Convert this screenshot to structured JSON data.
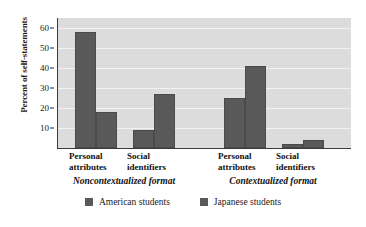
{
  "chart_data": {
    "type": "bar",
    "title": "",
    "xlabel": "",
    "ylabel": "Percent of self-statements",
    "ylim": [
      0,
      65
    ],
    "yticks": [
      10,
      20,
      30,
      40,
      50,
      60
    ],
    "grid": true,
    "legend_position": "bottom",
    "groups": [
      {
        "format_label": "Noncontextualized format",
        "categories": [
          "Personal attributes",
          "Social identifiers"
        ]
      },
      {
        "format_label": "Contextualized format",
        "categories": [
          "Personal attributes",
          "Social identifiers"
        ]
      }
    ],
    "categories": [
      "Personal attributes (Noncontextualized format)",
      "Social identifiers (Noncontextualized format)",
      "Personal attributes (Contextualized format)",
      "Social identifiers (Contextualized format)"
    ],
    "series": [
      {
        "name": "American students",
        "color": "#595959",
        "values": [
          58,
          9,
          25,
          2
        ]
      },
      {
        "name": "Japanese students",
        "color": "#595959",
        "values": [
          18,
          27,
          41,
          4
        ]
      }
    ]
  },
  "axis": {
    "y_title": "Percent of self-statements",
    "tick_labels": [
      "10",
      "20",
      "30",
      "40",
      "50",
      "60"
    ]
  },
  "category_labels": [
    {
      "line1": "Personal",
      "line2": "attributes"
    },
    {
      "line1": "Social",
      "line2": "identifiers"
    },
    {
      "line1": "Personal",
      "line2": "attributes"
    },
    {
      "line1": "Social",
      "line2": "identifiers"
    }
  ],
  "format_labels": [
    "Noncontextualized format",
    "Contextualized format"
  ],
  "legend": {
    "items": [
      {
        "label": "American students",
        "color": "#595959"
      },
      {
        "label": "Japanese students",
        "color": "#595959"
      }
    ]
  }
}
